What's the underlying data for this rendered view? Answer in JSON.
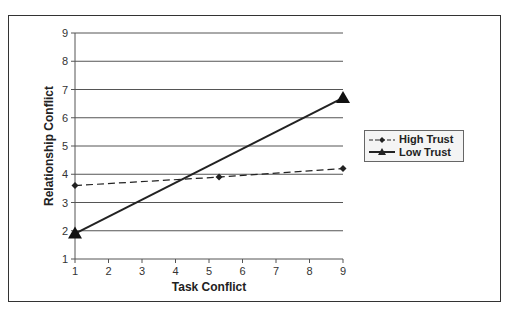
{
  "chart_data": {
    "type": "line",
    "title": "",
    "xlabel": "Task Conflict",
    "ylabel": "Relationship Conflict",
    "xlim": [
      1,
      9
    ],
    "ylim": [
      1,
      9
    ],
    "x_ticks": [
      "1",
      "2",
      "3",
      "4",
      "5",
      "6",
      "7",
      "8",
      "9"
    ],
    "y_ticks": [
      "1",
      "2",
      "3",
      "4",
      "5",
      "6",
      "7",
      "8",
      "9"
    ],
    "grid": "horizontal",
    "legend_position": "right",
    "series": [
      {
        "name": "High Trust",
        "style": "dashed",
        "marker": "diamond",
        "x": [
          1,
          5.3,
          9
        ],
        "y": [
          3.6,
          3.9,
          4.2
        ]
      },
      {
        "name": "Low Trust",
        "style": "solid",
        "marker": "triangle",
        "x": [
          1,
          9
        ],
        "y": [
          1.9,
          6.7
        ]
      }
    ]
  },
  "legend": {
    "items": [
      "High Trust",
      "Low Trust"
    ]
  }
}
